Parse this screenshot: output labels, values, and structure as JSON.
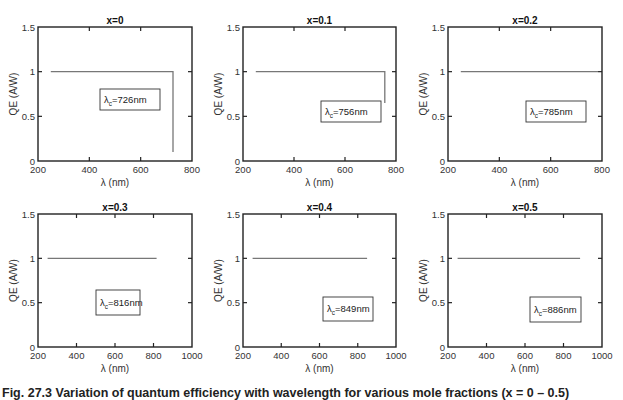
{
  "figure": {
    "caption": "Fig. 27.3 Variation of quantum efficiency with wavelength for various mole fractions (x = 0 – 0.5)"
  },
  "chart_data": [
    {
      "type": "line",
      "title": "x=0",
      "xlabel": "λ (nm)",
      "ylabel": "QE (A/W)",
      "xlim": [
        200,
        800
      ],
      "ylim": [
        0,
        1.5
      ],
      "xticks": [
        200,
        400,
        600,
        800
      ],
      "yticks": [
        0,
        0.5,
        1,
        1.5
      ],
      "series": [
        {
          "name": "QE",
          "x": [
            250,
            400,
            600,
            726,
            726
          ],
          "y": [
            1.0,
            1.0,
            1.0,
            1.0,
            0.1
          ]
        }
      ],
      "annotation": {
        "symbol": "λ",
        "subscript": "c",
        "text": "=726nm"
      },
      "grid": false
    },
    {
      "type": "line",
      "title": "x=0.1",
      "xlabel": "λ (nm)",
      "ylabel": "QE (A/W)",
      "xlim": [
        200,
        800
      ],
      "ylim": [
        0,
        1.5
      ],
      "xticks": [
        200,
        400,
        600,
        800
      ],
      "yticks": [
        0,
        0.5,
        1,
        1.5
      ],
      "series": [
        {
          "name": "QE",
          "x": [
            250,
            400,
            600,
            756,
            756
          ],
          "y": [
            1.0,
            1.0,
            1.0,
            1.0,
            0.65
          ]
        }
      ],
      "annotation": {
        "symbol": "λ",
        "subscript": "c",
        "text": "=756nm"
      },
      "grid": false
    },
    {
      "type": "line",
      "title": "x=0.2",
      "xlabel": "λ (nm)",
      "ylabel": "QE (A/W)",
      "xlim": [
        200,
        800
      ],
      "ylim": [
        0,
        1.5
      ],
      "xticks": [
        200,
        400,
        600,
        800
      ],
      "yticks": [
        0,
        0.5,
        1,
        1.5
      ],
      "series": [
        {
          "name": "QE",
          "x": [
            250,
            400,
            600,
            785
          ],
          "y": [
            1.0,
            1.0,
            1.0,
            1.0
          ]
        }
      ],
      "annotation": {
        "symbol": "λ",
        "subscript": "c",
        "text": "=785nm"
      },
      "grid": false
    },
    {
      "type": "line",
      "title": "x=0.3",
      "xlabel": "λ (nm)",
      "ylabel": "QE (A/W)",
      "xlim": [
        200,
        1000
      ],
      "ylim": [
        0,
        1.5
      ],
      "xticks": [
        200,
        400,
        600,
        800,
        1000
      ],
      "yticks": [
        0,
        0.5,
        1,
        1.5
      ],
      "series": [
        {
          "name": "QE",
          "x": [
            250,
            400,
            600,
            816
          ],
          "y": [
            1.0,
            1.0,
            1.0,
            1.0
          ]
        }
      ],
      "annotation": {
        "symbol": "λ",
        "subscript": "c",
        "text": "=816nm"
      },
      "grid": false
    },
    {
      "type": "line",
      "title": "x=0.4",
      "xlabel": "λ (nm)",
      "ylabel": "QE (A/W)",
      "xlim": [
        200,
        1000
      ],
      "ylim": [
        0,
        1.5
      ],
      "xticks": [
        200,
        400,
        600,
        800,
        1000
      ],
      "yticks": [
        0,
        0.5,
        1,
        1.5
      ],
      "series": [
        {
          "name": "QE",
          "x": [
            250,
            400,
            600,
            849
          ],
          "y": [
            1.0,
            1.0,
            1.0,
            1.0
          ]
        }
      ],
      "annotation": {
        "symbol": "λ",
        "subscript": "c",
        "text": "=849nm"
      },
      "grid": false
    },
    {
      "type": "line",
      "title": "x=0.5",
      "xlabel": "λ (nm)",
      "ylabel": "QE (A/W)",
      "xlim": [
        200,
        1000
      ],
      "ylim": [
        0,
        1.5
      ],
      "xticks": [
        200,
        400,
        600,
        800,
        1000
      ],
      "yticks": [
        0,
        0.5,
        1,
        1.5
      ],
      "series": [
        {
          "name": "QE",
          "x": [
            250,
            400,
            600,
            886
          ],
          "y": [
            1.0,
            1.0,
            1.0,
            1.0
          ]
        }
      ],
      "annotation": {
        "symbol": "λ",
        "subscript": "c",
        "text": "=886nm"
      },
      "grid": false
    }
  ],
  "layout": {
    "panels": [
      {
        "left": 38,
        "top": 27,
        "width": 154,
        "height": 134,
        "box": {
          "x": 100,
          "y": 89,
          "w": 60,
          "h": 21
        }
      },
      {
        "left": 243,
        "top": 27,
        "width": 153,
        "height": 134,
        "box": {
          "x": 321,
          "y": 101,
          "w": 60,
          "h": 21
        }
      },
      {
        "left": 448,
        "top": 27,
        "width": 154,
        "height": 134,
        "box": {
          "x": 526,
          "y": 101,
          "w": 60,
          "h": 21
        }
      },
      {
        "left": 38,
        "top": 214,
        "width": 154,
        "height": 133,
        "box": {
          "x": 96,
          "y": 290,
          "w": 44,
          "h": 25
        }
      },
      {
        "left": 243,
        "top": 214,
        "width": 153,
        "height": 133,
        "box": {
          "x": 323,
          "y": 297,
          "w": 50,
          "h": 24
        }
      },
      {
        "left": 448,
        "top": 214,
        "width": 154,
        "height": 133,
        "box": {
          "x": 530,
          "y": 297,
          "w": 51,
          "h": 25
        }
      }
    ],
    "line_color": "#777777",
    "axis_color": "#222222"
  }
}
